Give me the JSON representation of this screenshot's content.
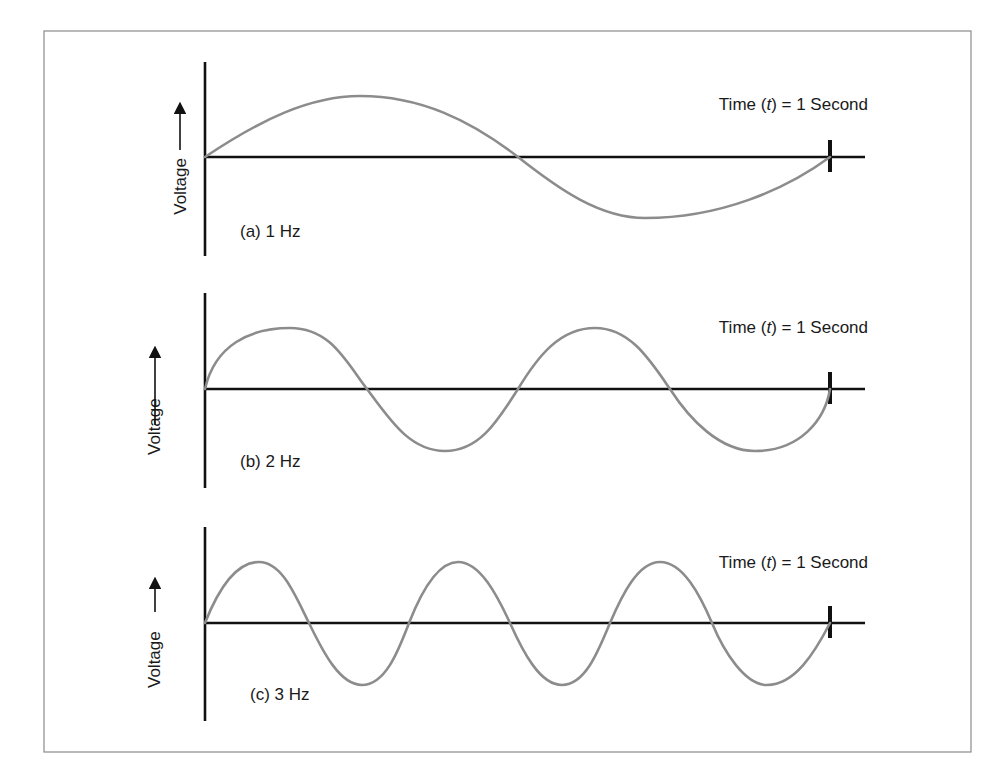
{
  "figure": {
    "type": "diagram",
    "colors": {
      "axis": "#111111",
      "wave": "#8c8c8c",
      "frame": "#8a8a8a"
    },
    "panels": [
      {
        "id": "a",
        "label": "(a) 1 Hz",
        "frequency_hz": 1,
        "y_axis_label": "Voltage",
        "y_axis_arrow": "→",
        "time_label_prefix": "Time (",
        "time_label_var": "t",
        "time_label_suffix": ") = 1 Second"
      },
      {
        "id": "b",
        "label": "(b) 2 Hz",
        "frequency_hz": 2,
        "y_axis_label": "Voltage",
        "y_axis_arrow": "→",
        "time_label_prefix": "Time (",
        "time_label_var": "t",
        "time_label_suffix": ") = 1 Second"
      },
      {
        "id": "c",
        "label": "(c) 3 Hz",
        "frequency_hz": 3,
        "y_axis_label": "Voltage",
        "y_axis_arrow": "→",
        "time_label_prefix": "Time (",
        "time_label_var": "t",
        "time_label_suffix": ") = 1 Second"
      }
    ]
  }
}
